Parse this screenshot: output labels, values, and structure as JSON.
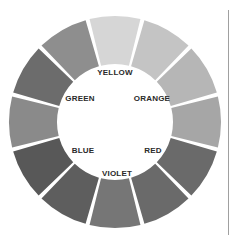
{
  "diagram": {
    "type": "color-wheel",
    "rendering": "grayscale",
    "segment_count": 12,
    "segments": [
      {
        "position": "12 o'clock",
        "fill": "#d6d6d6"
      },
      {
        "position": "1 o'clock",
        "fill": "#c4c4c4"
      },
      {
        "position": "2 o'clock",
        "fill": "#b6b6b6"
      },
      {
        "position": "3 o'clock",
        "fill": "#a6a6a6"
      },
      {
        "position": "4 o'clock",
        "fill": "#6a6a6a"
      },
      {
        "position": "5 o'clock",
        "fill": "#6a6a6a"
      },
      {
        "position": "6 o'clock",
        "fill": "#767676"
      },
      {
        "position": "7 o'clock",
        "fill": "#5e5e5e"
      },
      {
        "position": "8 o'clock",
        "fill": "#585858"
      },
      {
        "position": "9 o'clock",
        "fill": "#8a8a8a"
      },
      {
        "position": "10 o'clock",
        "fill": "#6c6c6c"
      },
      {
        "position": "11 o'clock",
        "fill": "#8e8e8e"
      }
    ],
    "labels": {
      "yellow": "YELLOW",
      "orange": "ORANGE",
      "red": "RED",
      "violet": "VIOLET",
      "blue": "BLUE",
      "green": "GREEN"
    }
  }
}
